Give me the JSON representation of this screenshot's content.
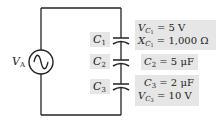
{
  "source": {
    "label_main": "V",
    "label_sub": "A",
    "icon": "ac-source-icon"
  },
  "capacitors": [
    {
      "label_main": "C",
      "label_sub": "1"
    },
    {
      "label_main": "C",
      "label_sub": "2"
    },
    {
      "label_main": "C",
      "label_sub": "3"
    }
  ],
  "info": {
    "c1": [
      {
        "var": "V",
        "sub1": "C",
        "sub2": "1",
        "value": " = 5 V"
      },
      {
        "var": "X",
        "sub1": "C",
        "sub2": "1",
        "value": " = 1,000 Ω"
      }
    ],
    "c2": [
      {
        "var": "C",
        "sub1": "2",
        "value": " = 5 μF"
      }
    ],
    "c3": [
      {
        "var": "C",
        "sub1": "3",
        "value": " = 2 μF"
      },
      {
        "var": "V",
        "sub1": "C",
        "sub2": "3",
        "value": " = 10 V"
      }
    ]
  },
  "colors": {
    "wire": "#222222",
    "label_box": "#e6e6e6"
  }
}
